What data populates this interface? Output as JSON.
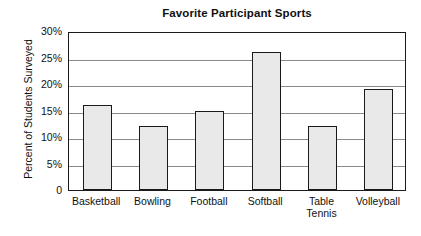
{
  "chart_data": {
    "type": "bar",
    "title": "Favorite Participant Sports",
    "xlabel": "",
    "ylabel": "Percent of Students Surveyed",
    "categories": [
      "Basketball",
      "Bowling",
      "Football",
      "Softball",
      "Table Tennis",
      "Volleyball"
    ],
    "values": [
      16,
      12,
      15,
      26,
      12,
      19
    ],
    "ylim": [
      0,
      30
    ],
    "ytick_labels": [
      "0",
      "5%",
      "10%",
      "15%",
      "20%",
      "25%",
      "30%"
    ],
    "ytick_values": [
      0,
      5,
      10,
      15,
      20,
      25,
      30
    ],
    "grid": true,
    "legend": "none",
    "series": [
      {
        "name": "Percent of Students Surveyed",
        "values": [
          16,
          12,
          15,
          26,
          12,
          19
        ]
      }
    ],
    "colors": {
      "bar_fill": "#e9e9e9",
      "bar_edge": "#1a1a1a",
      "grid": "#8a8a8a",
      "axis": "#1a1a1a",
      "background": "#ffffff",
      "text": "#111111"
    }
  },
  "xtick_lines": [
    [
      "Basketball"
    ],
    [
      "Bowling"
    ],
    [
      "Football"
    ],
    [
      "Softball"
    ],
    [
      "Table",
      "Tennis"
    ],
    [
      "Volleyball"
    ]
  ]
}
